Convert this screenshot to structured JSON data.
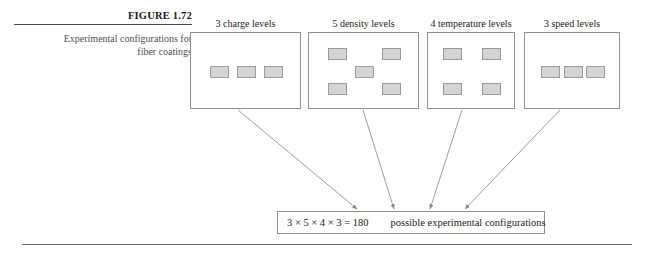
{
  "caption": {
    "figure_number": "FIGURE 1.72",
    "line1": "Experimental configurations for",
    "line2": "fiber coatings"
  },
  "factors": [
    {
      "id": "charge",
      "label": "3 charge levels",
      "count": 3,
      "pattern": "row-of-three",
      "box": {
        "left": 190,
        "top": 18,
        "width": 111,
        "height": 77
      }
    },
    {
      "id": "density",
      "label": "5 density levels",
      "count": 5,
      "pattern": "dice-five",
      "box": {
        "left": 308,
        "top": 18,
        "width": 111,
        "height": 77
      }
    },
    {
      "id": "temperature",
      "label": "4 temperature levels",
      "count": 4,
      "pattern": "four-corners",
      "box": {
        "left": 427,
        "top": 18,
        "width": 88,
        "height": 77
      }
    },
    {
      "id": "speed",
      "label": "3 speed levels",
      "count": 3,
      "pattern": "row-of-three",
      "box": {
        "left": 524,
        "top": 18,
        "width": 96,
        "height": 77
      }
    }
  ],
  "result": {
    "formula": "3 × 5 × 4 × 3 = 180",
    "text": "possible experimental configurations"
  },
  "arrows": [
    {
      "from_factor": "charge",
      "x1": 238,
      "y1": 110,
      "x2": 357,
      "y2": 209
    },
    {
      "from_factor": "density",
      "x1": 363,
      "y1": 110,
      "x2": 394,
      "y2": 209
    },
    {
      "from_factor": "temperature",
      "x1": 462,
      "y1": 110,
      "x2": 430,
      "y2": 209
    },
    {
      "from_factor": "speed",
      "x1": 560,
      "y1": 110,
      "x2": 465,
      "y2": 209
    }
  ],
  "colors": {
    "page_background": "#ffffff",
    "box_border": "#8e8e8e",
    "cell_fill": "#d4d4d4",
    "cell_border": "#9a9a9a",
    "rule": "#6f6f6f",
    "caption_text": "#4f4f4f",
    "body_text": "#1b1b1b",
    "arrow": "#8a8a8a"
  }
}
